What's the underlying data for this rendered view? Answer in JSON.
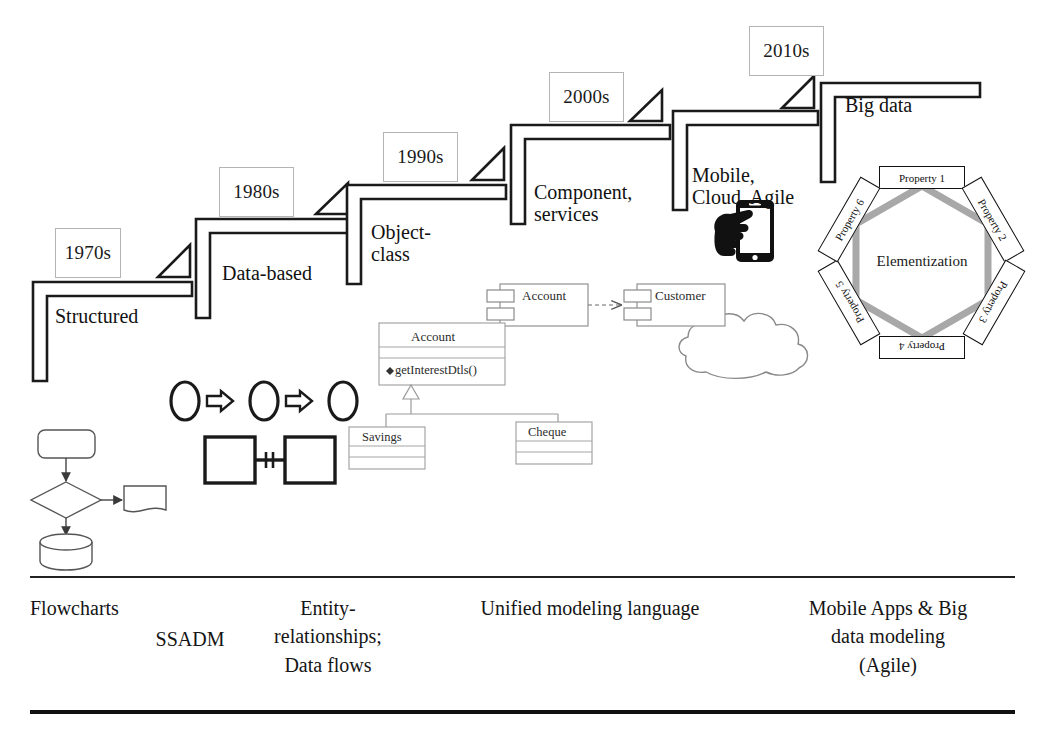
{
  "figure": {
    "background": "#ffffff",
    "stroke_dark": "#1a1a1a",
    "stroke_light": "#b4b4b4",
    "hex_stroke": "#a8a8a8"
  },
  "steps": [
    {
      "id": "step-1970s",
      "year": "1970s",
      "label": "Structured",
      "year_box": {
        "x": 55,
        "y": 228,
        "w": 64,
        "h": 48
      },
      "stair": {
        "x": 32,
        "y": 281,
        "w": 160,
        "h": 100
      },
      "triangle": {
        "x": 158,
        "y": 245,
        "size": 32
      },
      "label_pos": {
        "x": 55,
        "y": 305
      }
    },
    {
      "id": "step-1980s",
      "year": "1980s",
      "label": "Data-based",
      "year_box": {
        "x": 219,
        "y": 167,
        "w": 73,
        "h": 48
      },
      "stair": {
        "x": 196,
        "y": 218,
        "w": 160,
        "h": 100
      },
      "triangle": {
        "x": 316,
        "y": 183,
        "size": 32
      },
      "label_pos": {
        "x": 222,
        "y": 265
      }
    },
    {
      "id": "step-1990s",
      "year": "1990s",
      "label": "Object-\nclass",
      "year_box": {
        "x": 383,
        "y": 132,
        "w": 73,
        "h": 48
      },
      "stair": {
        "x": 346,
        "y": 184,
        "w": 160,
        "h": 100
      },
      "triangle": {
        "x": 472,
        "y": 148,
        "size": 32
      },
      "label_pos": {
        "x": 372,
        "y": 223
      }
    },
    {
      "id": "step-2000s",
      "year": "2000s",
      "label": "Component,\nservices",
      "year_box": {
        "x": 549,
        "y": 72,
        "w": 73,
        "h": 48
      },
      "stair": {
        "x": 510,
        "y": 124,
        "w": 160,
        "h": 100
      },
      "triangle": {
        "x": 631,
        "y": 90,
        "size": 32
      },
      "label_pos": {
        "x": 534,
        "y": 183
      }
    },
    {
      "id": "step-2010s-mobile",
      "year": "",
      "label": "Mobile,\nCloud, Agile",
      "year_box": null,
      "stair": {
        "x": 672,
        "y": 110,
        "w": 150,
        "h": 100
      },
      "triangle": {
        "x": 783,
        "y": 76,
        "size": 32
      },
      "label_pos": {
        "x": 692,
        "y": 166
      }
    },
    {
      "id": "step-2010s-bigdata",
      "year": "2010s",
      "label": "Big data",
      "year_box": {
        "x": 749,
        "y": 26,
        "w": 73,
        "h": 48
      },
      "stair": {
        "x": 820,
        "y": 82,
        "w": 160,
        "h": 100
      },
      "triangle": null,
      "label_pos": {
        "x": 845,
        "y": 97
      }
    }
  ],
  "hexagon": {
    "center_label": "Elementization",
    "center": {
      "x": 922,
      "y": 262
    },
    "radius": 76,
    "stroke": "#a8a8a8",
    "stroke_width": 7,
    "properties": [
      {
        "label": "Property 1",
        "x": 922,
        "y": 178,
        "rotate": 0
      },
      {
        "label": "Property 2",
        "x": 993,
        "y": 220,
        "rotate": 60
      },
      {
        "label": "Property 3",
        "x": 994,
        "y": 303,
        "rotate": 120
      },
      {
        "label": "Property 4",
        "x": 922,
        "y": 348,
        "rotate": 180
      },
      {
        "label": "Property 5",
        "x": 849,
        "y": 303,
        "rotate": 240
      },
      {
        "label": "Property 6",
        "x": 849,
        "y": 220,
        "rotate": 300
      }
    ]
  },
  "uml": {
    "component_diagram": {
      "source": "Account",
      "target": "Customer",
      "relation": "dependency"
    },
    "class_diagram": {
      "parent": {
        "name": "Account",
        "operation": "getInterestDtls()"
      },
      "children": [
        {
          "name": "Savings"
        },
        {
          "name": "Cheque"
        }
      ],
      "relation": "generalization"
    }
  },
  "icons": {
    "phone": "hand-holding-phone-icon",
    "cloud": "cloud-icon",
    "flowchart": "flowchart-icon",
    "er_entities": "entity-relationship-icon",
    "process_chain": "process-chain-icon"
  },
  "caption": {
    "columns": [
      {
        "id": "caption-flowcharts",
        "text": "Flowcharts",
        "x": 30,
        "y": 595,
        "w": 180,
        "align": "left"
      },
      {
        "id": "caption-ssadm",
        "text": "SSADM",
        "x": 120,
        "y": 625,
        "w": 140,
        "align": "center"
      },
      {
        "id": "caption-er",
        "text": "Entity-\nrelationships;\nData flows",
        "x": 240,
        "y": 594,
        "w": 180,
        "align": "center"
      },
      {
        "id": "caption-uml",
        "text": "Unified modeling language",
        "x": 440,
        "y": 594,
        "w": 300,
        "align": "center"
      },
      {
        "id": "caption-mobile",
        "text": "Mobile Apps & Big\ndata modeling\n(Agile)",
        "x": 770,
        "y": 594,
        "w": 240,
        "align": "center"
      }
    ],
    "rule_top_y": 576,
    "rule_bottom_y": 712
  }
}
